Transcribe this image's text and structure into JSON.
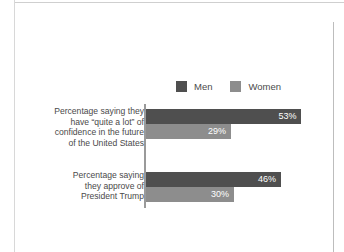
{
  "chart_data": {
    "type": "bar",
    "orientation": "horizontal",
    "title": "",
    "subtitle": "",
    "xlabel": "",
    "ylabel": "",
    "grid": false,
    "legend_position": "top-right",
    "xlim": [
      0,
      60
    ],
    "value_suffix": "%",
    "categories": [
      "Percentage saying they\nhave “quite a lot” of\nconfidence in the future\nof the United States",
      "Percentage saying\nthey approve of\nPresident Trump"
    ],
    "series": [
      {
        "name": "Men",
        "color": "#4f4f4f",
        "values": [
          53,
          46
        ],
        "labels": [
          "53%",
          "46%"
        ]
      },
      {
        "name": "Women",
        "color": "#8d8d8d",
        "values": [
          29,
          30
        ],
        "labels": [
          "29%",
          "30%"
        ]
      }
    ]
  },
  "legend": {
    "items": [
      {
        "label": "Men",
        "color": "#4f4f4f"
      },
      {
        "label": "Women",
        "color": "#8d8d8d"
      }
    ]
  },
  "groups": [
    {
      "label": "Percentage saying they\nhave “quite a lot” of\nconfidence in the future\nof the United States",
      "bars": [
        {
          "series": "Men",
          "value": 53,
          "label": "53%"
        },
        {
          "series": "Women",
          "value": 29,
          "label": "29%"
        }
      ]
    },
    {
      "label": "Percentage saying\nthey approve of\nPresident Trump",
      "bars": [
        {
          "series": "Men",
          "value": 46,
          "label": "46%"
        },
        {
          "series": "Women",
          "value": 30,
          "label": "30%"
        }
      ]
    }
  ],
  "colors": {
    "men": "#4f4f4f",
    "women": "#8d8d8d",
    "axis": "#9a9a9a",
    "text": "#4a4a4a",
    "value_text": "#ffffff",
    "background": "#ffffff"
  }
}
